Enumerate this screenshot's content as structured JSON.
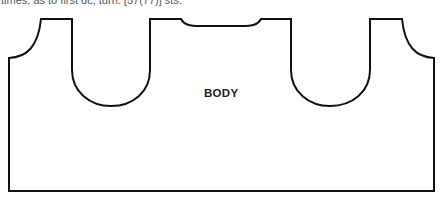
{
  "header": {
    "clipped_text": "times, as to first dc, turn. [57(77)] sts."
  },
  "diagram": {
    "piece_label": "BODY",
    "stroke_color": "#111111",
    "fill_color": "#ffffff"
  }
}
